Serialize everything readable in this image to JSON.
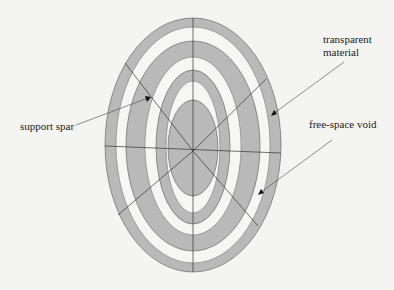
{
  "diagram": {
    "labels": {
      "transparent_material": "transparent\nmaterial",
      "transparent_material_line1": "transparent",
      "transparent_material_line2": "material",
      "free_space_void": "free-space void",
      "support_spar": "support spar"
    },
    "rings": [
      {
        "name": "outer-transparent-ring",
        "type": "transparent material"
      },
      {
        "name": "outer-void-ring",
        "type": "free-space void"
      },
      {
        "name": "middle-transparent-ring",
        "type": "transparent material"
      },
      {
        "name": "middle-void-ring",
        "type": "free-space void"
      },
      {
        "name": "inner-transparent-ring",
        "type": "transparent material"
      },
      {
        "name": "inner-void-ring",
        "type": "free-space void"
      },
      {
        "name": "core-transparent-ellipse",
        "type": "transparent material"
      }
    ],
    "spar_count": 8,
    "colors": {
      "material": "#b9b9b9",
      "void": "#f6f6f4",
      "background": "#f4f4f2",
      "lines": "#333333"
    }
  }
}
